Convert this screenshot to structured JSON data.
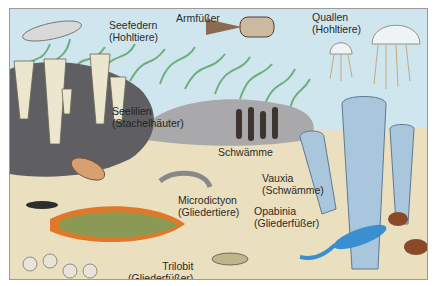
{
  "illustration": {
    "subject": "Cambrian sea floor (Burgess Shale fauna)",
    "colors": {
      "water": "#cfe6ef",
      "sand": "#eadfbe",
      "rock_dark": "#5f5f63",
      "rock_light": "#a9a9ab",
      "seaweed": "#6fae7c",
      "sponge_blue": "#a9c6dc",
      "trilobite_orange": "#e0782a",
      "trilobite_green": "#8a9a55",
      "opabinia_blue": "#3a8fd0"
    },
    "labels": [
      {
        "id": "seefedern",
        "name": "Seefedern",
        "group": "(Hohltiere)"
      },
      {
        "id": "armfuesser",
        "name": "Armfüßer",
        "group": ""
      },
      {
        "id": "quallen",
        "name": "Quallen",
        "group": "(Hohltiere)"
      },
      {
        "id": "seelilien",
        "name": "Seelilien",
        "group": "(Stachelhäuter)"
      },
      {
        "id": "schwaemme",
        "name": "Schwämme",
        "group": ""
      },
      {
        "id": "vauxia",
        "name": "Vauxia",
        "group": "(Schwämme)"
      },
      {
        "id": "microdictyon",
        "name": "Microdictyon",
        "group": "(Gliedertiere)"
      },
      {
        "id": "opabinia",
        "name": "Opabinia",
        "group": "(Gliederfüßer)"
      },
      {
        "id": "trilobit",
        "name": "Trilobit",
        "group": "(Gliederfüßer)"
      }
    ]
  }
}
